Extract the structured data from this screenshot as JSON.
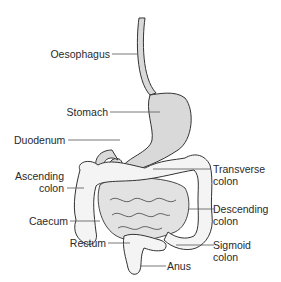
{
  "colors": {
    "organ_fill": "#d9d9d9",
    "colon_fill": "#f4f4f4",
    "outline": "#333333",
    "leader": "#555555",
    "text": "#2a2a2a"
  },
  "labels": {
    "oesophagus": "Oesophagus",
    "stomach": "Stomach",
    "duodenum": "Duodenum",
    "ascending_colon_1": "Ascending",
    "ascending_colon_2": "colon",
    "caecum": "Caecum",
    "rectum": "Rectum",
    "transverse_colon_1": "Transverse",
    "transverse_colon_2": "colon",
    "descending_colon_1": "Descending",
    "descending_colon_2": "colon",
    "sigmoid_colon_1": "Sigmoid",
    "sigmoid_colon_2": "colon",
    "anus": "Anus"
  }
}
